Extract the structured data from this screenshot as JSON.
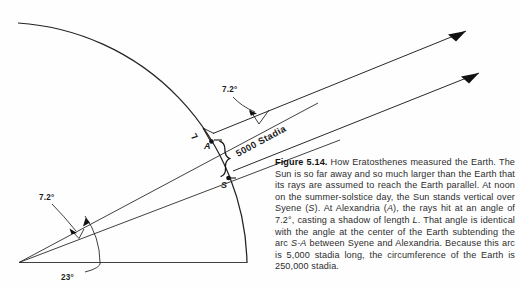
{
  "figure": {
    "label_bold": "Figure 5.14.",
    "caption_text": " How Eratosthenes measured the Earth. The Sun is so far away and so much larger than the Earth that its rays are assumed to reach the Earth parallel. At noon on the summer-solstice day, the Sun stands vertical over Syene (",
    "caption_part2": "). At Alexandria (",
    "caption_part3": "), the rays hit at an angle of 7.2°, casting a shadow of length ",
    "caption_part4": ". That angle is identical with the angle at the center of the Earth subtending the arc ",
    "caption_part5": " between Syene and Alexandria. Because this arc is 5,000 stadia long, the circumference of the Earth is 250,000 stadia.",
    "italic_S": "S",
    "italic_A": "A",
    "italic_L": "L",
    "italic_SA": "S-A"
  },
  "diagram": {
    "angle_sun_label": "7.2°",
    "angle_center_label": "7.2°",
    "angle_tilt_label": "23°",
    "point_alexandria": "A",
    "point_syene": "S",
    "shadow_label": "L",
    "arc_distance_label": "5000 Stadia",
    "line_color": "#1c1c1c",
    "background": "#fefefe"
  }
}
